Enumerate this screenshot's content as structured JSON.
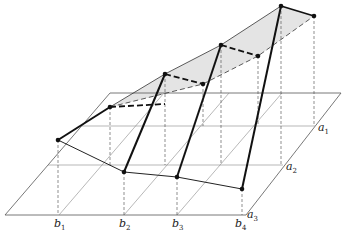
{
  "diagram": {
    "type": "3d-perspective-construction",
    "colors": {
      "background": "#ffffff",
      "line": "#1a1a1a",
      "grid": "#6a6a6a",
      "fill": "#e6e6e6"
    },
    "labels": {
      "a": [
        {
          "base": "a",
          "sub": "1"
        },
        {
          "base": "a",
          "sub": "2"
        },
        {
          "base": "a",
          "sub": "3"
        }
      ],
      "b": [
        {
          "base": "b",
          "sub": "1"
        },
        {
          "base": "b",
          "sub": "2"
        },
        {
          "base": "b",
          "sub": "3"
        },
        {
          "base": "b",
          "sub": "4"
        }
      ]
    },
    "base_plane": {
      "corners": [
        [
          5,
          215
        ],
        [
          246,
          215
        ],
        [
          341,
          93
        ],
        [
          110,
          93
        ]
      ]
    },
    "lower_points": [
      [
        58,
        140
      ],
      [
        124,
        172
      ],
      [
        177,
        177
      ],
      [
        242,
        189
      ]
    ],
    "upper_points_front": [
      [
        110,
        107
      ],
      [
        165,
        74
      ],
      [
        221,
        45
      ],
      [
        281,
        6
      ]
    ],
    "upper_points_back": [
      [
        203,
        84
      ],
      [
        258,
        56
      ],
      [
        314,
        16
      ]
    ]
  }
}
